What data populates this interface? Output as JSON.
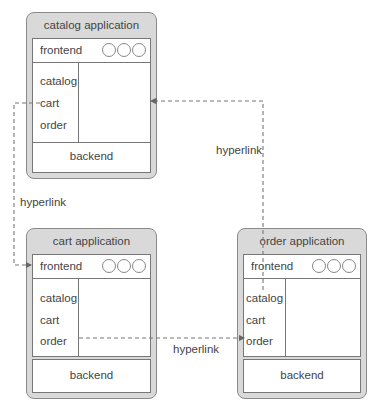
{
  "apps": {
    "catalog": {
      "title": "catalog application",
      "frontend": "frontend",
      "links": [
        "catalog",
        "cart",
        "order"
      ],
      "backend": "backend"
    },
    "cart": {
      "title": "cart application",
      "frontend": "frontend",
      "links": [
        "catalog",
        "cart",
        "order"
      ],
      "backend": "backend"
    },
    "order": {
      "title": "order application",
      "frontend": "frontend",
      "links": [
        "catalog",
        "cart",
        "order"
      ],
      "backend": "backend"
    }
  },
  "connections": [
    {
      "from": "catalog.cart",
      "to": "cart.frontend",
      "label": "hyperlink"
    },
    {
      "from": "cart.order",
      "to": "order.order",
      "label": "hyperlink"
    },
    {
      "from": "order.frontend",
      "to": "catalog.frontend",
      "label": "hyperlink"
    }
  ],
  "colors": {
    "box_fill": "#d9d9d9",
    "border": "#8a8a8a",
    "dash": "#777777"
  }
}
